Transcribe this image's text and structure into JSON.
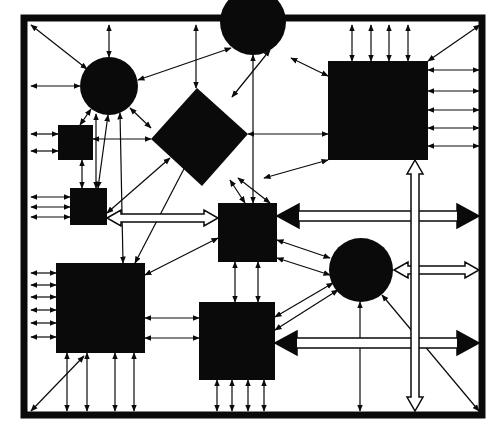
{
  "diagram": {
    "title": "Block interconnect diagram",
    "colors": {
      "ink": "#0a0a0a",
      "background": "#ffffff",
      "bus_fill": "#ffffff"
    },
    "frame": {
      "x": 24,
      "y": 18,
      "width": 458,
      "height": 397,
      "stroke_width": 7
    },
    "nodes": [
      {
        "id": "circle-top-left",
        "shape": "circle",
        "cx": 109,
        "cy": 86,
        "r": 29
      },
      {
        "id": "semicircle-top-center",
        "shape": "circle",
        "cx": 253,
        "cy": 22,
        "r": 33
      },
      {
        "id": "square-large-top-right",
        "shape": "rect",
        "x": 328,
        "y": 61,
        "w": 100,
        "h": 99
      },
      {
        "id": "diamond-center",
        "shape": "diamond",
        "points": "197,88 248,134 202,186 151,139"
      },
      {
        "id": "square-small-left",
        "shape": "rect",
        "x": 58,
        "y": 125,
        "w": 35,
        "h": 35
      },
      {
        "id": "square-small-left-2",
        "shape": "rect",
        "x": 70,
        "y": 188,
        "w": 37,
        "h": 37
      },
      {
        "id": "square-center",
        "shape": "rect",
        "x": 218,
        "y": 203,
        "w": 59,
        "h": 59
      },
      {
        "id": "circle-right",
        "shape": "circle",
        "cx": 361,
        "cy": 270,
        "r": 32
      },
      {
        "id": "square-large-bottom-left",
        "shape": "rect",
        "x": 56,
        "y": 263,
        "w": 89,
        "h": 90
      },
      {
        "id": "square-bottom-center",
        "shape": "rect",
        "x": 199,
        "y": 302,
        "w": 76,
        "h": 78
      }
    ],
    "buses": [
      {
        "id": "bus-horizontal-top",
        "x1": 277,
        "x2": 479,
        "y": 216,
        "style": "filled-heads"
      },
      {
        "id": "bus-horizontal-middle",
        "x1": 394,
        "x2": 479,
        "y": 270,
        "style": "hollow-heads"
      },
      {
        "id": "bus-horizontal-bottom",
        "x1": 275,
        "x2": 479,
        "y": 343,
        "style": "filled-heads"
      },
      {
        "id": "bus-horizontal-left",
        "x1": 107,
        "x2": 218,
        "y": 218,
        "style": "hollow-heads"
      },
      {
        "id": "bus-vertical-right",
        "x": 415,
        "y1": 160,
        "y2": 411,
        "style": "hollow-heads"
      }
    ],
    "links": [
      [
        31,
        25,
        87,
        69
      ],
      [
        109,
        25,
        109,
        57
      ],
      [
        31,
        86,
        80,
        86
      ],
      [
        196,
        25,
        196,
        88
      ],
      [
        253,
        55,
        253,
        203
      ],
      [
        138,
        80,
        231,
        48
      ],
      [
        270,
        50,
        232,
        97
      ],
      [
        291,
        58,
        328,
        76
      ],
      [
        480,
        25,
        428,
        61
      ],
      [
        352,
        25,
        352,
        61
      ],
      [
        371,
        25,
        371,
        61
      ],
      [
        389,
        25,
        389,
        61
      ],
      [
        408,
        25,
        408,
        61
      ],
      [
        428,
        70,
        479,
        70
      ],
      [
        428,
        91,
        479,
        91
      ],
      [
        428,
        110,
        479,
        110
      ],
      [
        428,
        128,
        479,
        128
      ],
      [
        428,
        146,
        479,
        146
      ],
      [
        248,
        134,
        328,
        134
      ],
      [
        264,
        178,
        328,
        160
      ],
      [
        31,
        134,
        58,
        134
      ],
      [
        31,
        151,
        58,
        151
      ],
      [
        93,
        139,
        151,
        139
      ],
      [
        91,
        109,
        80,
        125
      ],
      [
        130,
        108,
        151,
        128
      ],
      [
        82,
        160,
        82,
        188
      ],
      [
        96,
        114,
        96,
        188
      ],
      [
        120,
        113,
        123,
        263
      ],
      [
        108,
        115,
        98,
        188
      ],
      [
        31,
        197,
        70,
        197
      ],
      [
        31,
        207,
        70,
        207
      ],
      [
        31,
        217,
        70,
        217
      ],
      [
        107,
        213,
        170,
        158
      ],
      [
        135,
        263,
        187,
        163
      ],
      [
        230,
        180,
        245,
        203
      ],
      [
        238,
        178,
        270,
        203
      ],
      [
        145,
        275,
        218,
        238
      ],
      [
        277,
        240,
        330,
        258
      ],
      [
        277,
        258,
        330,
        275
      ],
      [
        31,
        273,
        56,
        273
      ],
      [
        31,
        285,
        56,
        285
      ],
      [
        31,
        297,
        56,
        297
      ],
      [
        31,
        310,
        56,
        310
      ],
      [
        31,
        323,
        56,
        323
      ],
      [
        31,
        337,
        56,
        337
      ],
      [
        145,
        318,
        199,
        318
      ],
      [
        145,
        338,
        199,
        338
      ],
      [
        235,
        262,
        235,
        302
      ],
      [
        258,
        262,
        258,
        302
      ],
      [
        67,
        353,
        67,
        411
      ],
      [
        87,
        353,
        87,
        411
      ],
      [
        115,
        353,
        115,
        411
      ],
      [
        134,
        353,
        134,
        411
      ],
      [
        31,
        411,
        84,
        356
      ],
      [
        217,
        380,
        217,
        411
      ],
      [
        232,
        380,
        232,
        411
      ],
      [
        248,
        380,
        248,
        411
      ],
      [
        264,
        380,
        264,
        411
      ],
      [
        275,
        317,
        333,
        283
      ],
      [
        275,
        330,
        338,
        290
      ],
      [
        360,
        302,
        360,
        411
      ],
      [
        382,
        295,
        479,
        411
      ],
      [
        432,
        25,
        432,
        25
      ]
    ]
  }
}
